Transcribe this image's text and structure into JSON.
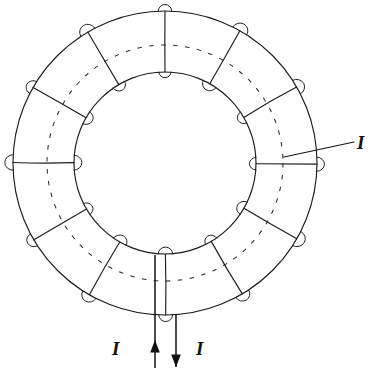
{
  "figure": {
    "name": "toroidal-coil-cross-section",
    "background_color": "#ffffff",
    "line_color": "#1c1c1c"
  },
  "geometry": {
    "center_x": 165,
    "center_y": 163,
    "outer_radius": 152,
    "inner_radius": 91,
    "mid_dashed_radius": 118,
    "turn_count": 12,
    "start_angle_deg": -90,
    "bump_radius": 7.5
  },
  "labels": {
    "current_right": "I",
    "current_left": "I",
    "current_bottom_right": "I"
  },
  "leader": {
    "x1": 284,
    "y1": 157,
    "x2": 354,
    "y2": 142
  },
  "leads": {
    "inflow": {
      "name": "current-in-lead",
      "x": 155,
      "y_top": 255,
      "y_bottom": 368,
      "arrow_direction": "up",
      "arrow_tip_y": 340
    },
    "outflow": {
      "name": "current-out-lead",
      "x": 176,
      "y_top": 314,
      "y_bottom": 367,
      "arrow_direction": "down",
      "arrow_tip_y": 367
    }
  },
  "chart_data": {
    "type": "diagram",
    "title": "",
    "elements": [
      "outer-circle",
      "inner-circle",
      "dashed-mid-circle",
      "radial-winding-lines",
      "winding-bumps-outer",
      "winding-bumps-inner",
      "current-leads",
      "current-labels"
    ]
  }
}
